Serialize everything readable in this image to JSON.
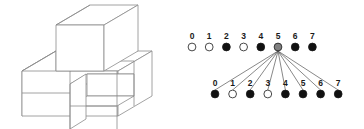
{
  "figure": {
    "background_color": "#ffffff"
  },
  "block_diagram": {
    "name": "isometric-block-structure",
    "line_color": "#8c8c8c",
    "face_color": "#ffffff",
    "description": "Wireframe isometric stack of cubes: one cube on top of a wider lower slab with a notch/gap cut into the front",
    "cube_count_visible": 7
  },
  "graph": {
    "line_color": "#555555",
    "filled_color": "#111111",
    "empty_color": "#ffffff",
    "highlight_color": "#808080",
    "rows": [
      {
        "id": "parent-row",
        "name": "top-node-row",
        "labels": [
          "0",
          "1",
          "2",
          "3",
          "4",
          "5",
          "6",
          "7"
        ],
        "states": [
          "empty",
          "empty",
          "filled",
          "empty",
          "filled",
          "highlight",
          "filled",
          "filled"
        ],
        "x_positions": [
          192,
          209.2,
          226.4,
          243.6,
          260.8,
          278,
          295.2,
          312.4
        ],
        "label_y": 39,
        "dot_y": 47,
        "dot_radius": 3.9
      },
      {
        "id": "child-row",
        "name": "bottom-node-row",
        "labels": [
          "0",
          "1",
          "2",
          "3",
          "4",
          "5",
          "6",
          "7"
        ],
        "states": [
          "filled",
          "empty",
          "filled",
          "empty",
          "filled",
          "filled",
          "filled",
          "filled"
        ],
        "x_positions": [
          215,
          232.6,
          250.2,
          267.8,
          285.4,
          303,
          320.6,
          338.2
        ],
        "label_y": 86,
        "dot_y": 94,
        "dot_radius": 3.9
      }
    ],
    "fan": {
      "name": "expansion-fan",
      "source_row": "parent-row",
      "source_index": 5,
      "source_x": 278,
      "source_y": 51,
      "target_row": "child-row",
      "target_y": 90,
      "target_x_positions": [
        215,
        232.6,
        250.2,
        267.8,
        285.4,
        303,
        320.6,
        338.2
      ]
    }
  }
}
